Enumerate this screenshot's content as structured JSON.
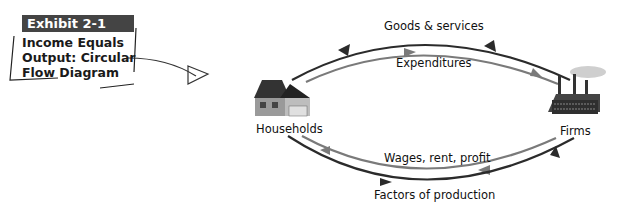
{
  "exhibit": {
    "tab": "Exhibit 2-1",
    "title_lines": [
      "Income Equals",
      "Output: Circular",
      "Flow Diagram"
    ]
  },
  "nodes": {
    "left": {
      "label": "Households",
      "icon": "house-icon"
    },
    "right": {
      "label": "Firms",
      "icon": "factory-icon"
    }
  },
  "flows": {
    "goods": "Goods & services",
    "expenditures": "Expenditures",
    "wages": "Wages, rent, profit",
    "factors": "Factors of production"
  },
  "colors": {
    "dark_arrow": "#2b2b2b",
    "light_arrow": "#7a7a7a",
    "tab_bg": "#444444"
  }
}
